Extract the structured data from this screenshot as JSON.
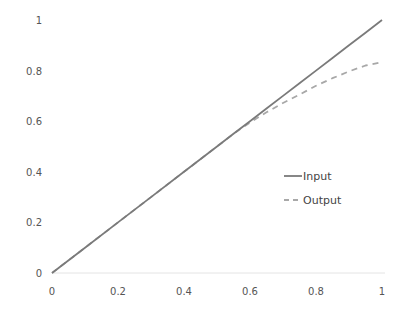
{
  "chart_data": {
    "type": "line",
    "title": "",
    "xlabel": "",
    "ylabel": "",
    "xlim": [
      0,
      1
    ],
    "ylim": [
      0,
      1
    ],
    "grid": false,
    "legend_position": "center-right",
    "x_ticks": [
      "0",
      "0.2",
      "0.4",
      "0.6",
      "0.8",
      "1"
    ],
    "y_ticks": [
      "0",
      "0.2",
      "0.4",
      "0.6",
      "0.8",
      "1"
    ],
    "x": [
      0,
      0.1,
      0.2,
      0.3,
      0.4,
      0.5,
      0.55,
      0.6,
      0.65,
      0.7,
      0.75,
      0.8,
      0.85,
      0.9,
      0.95,
      1.0
    ],
    "series": [
      {
        "name": "Input",
        "style": "solid",
        "color": "#7a7a7a",
        "values": [
          0,
          0.1,
          0.2,
          0.3,
          0.4,
          0.5,
          0.55,
          0.6,
          0.65,
          0.7,
          0.75,
          0.8,
          0.85,
          0.9,
          0.95,
          1.0
        ]
      },
      {
        "name": "Output",
        "style": "dashed",
        "color": "#a8a8a8",
        "values": [
          0,
          0.1,
          0.2,
          0.3,
          0.4,
          0.5,
          0.55,
          0.595,
          0.635,
          0.672,
          0.705,
          0.74,
          0.77,
          0.797,
          0.82,
          0.834
        ]
      }
    ]
  }
}
